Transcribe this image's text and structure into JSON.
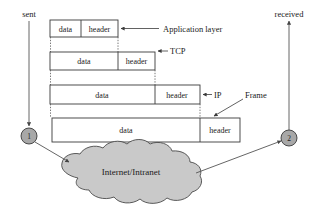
{
  "diagram": {
    "colors": {
      "cloud_fill": "#c9c9c9",
      "node_fill": "#a8a8a8",
      "stroke": "#3a3a3a",
      "background": "#ffffff"
    },
    "endpoints": {
      "sent_label": "sent",
      "received_label": "received",
      "node_left_label": "1",
      "node_right_label": "2"
    },
    "network": {
      "cloud_label": "Internet/Intranet"
    },
    "layers": [
      {
        "annotation": "Application layer",
        "data_label": "data",
        "header_label": "header"
      },
      {
        "annotation": "TCP",
        "data_label": "data",
        "header_label": "header"
      },
      {
        "annotation": "IP",
        "data_label": "data",
        "header_label": "header"
      },
      {
        "annotation": "Frame",
        "data_label": "data",
        "header_label": "header"
      }
    ]
  }
}
